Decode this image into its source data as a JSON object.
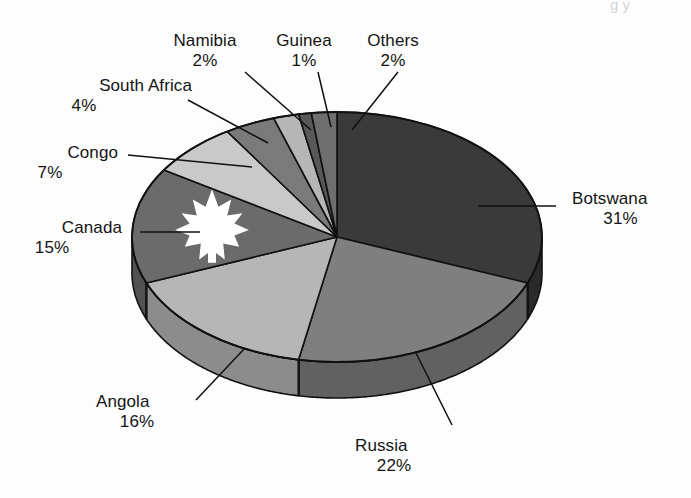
{
  "figure": {
    "background": "#fdfdfd",
    "width": 691,
    "height": 498,
    "clipped_top_text": "g y"
  },
  "chart_data": {
    "type": "pie",
    "title": "",
    "subtitle": "",
    "xlabel": "",
    "ylabel": "",
    "style": "3d-pie",
    "legend_position": "none",
    "labels_position": "outside-with-leader-lines",
    "start_angle_deg": 0,
    "direction": "clockwise",
    "categories": [
      "Botswana",
      "Russia",
      "Angola",
      "Canada",
      "Congo",
      "South Africa",
      "Namibia",
      "Guinea",
      "Others"
    ],
    "values": [
      31,
      22,
      16,
      15,
      7,
      4,
      2,
      1,
      2
    ],
    "value_unit": "%",
    "total": 100,
    "slices": [
      {
        "label": "Botswana",
        "value": 31,
        "pct_text": "31%",
        "color": "#3a3a3a",
        "side_color": "#2a2a2a"
      },
      {
        "label": "Russia",
        "value": 22,
        "pct_text": "22%",
        "color": "#7f7f7f",
        "side_color": "#616161"
      },
      {
        "label": "Angola",
        "value": 16,
        "pct_text": "16%",
        "color": "#b6b6b6",
        "side_color": "#8c8c8c"
      },
      {
        "label": "Canada",
        "value": 15,
        "pct_text": "15%",
        "color": "#6b6b6b",
        "side_color": "#525252",
        "emblem": "maple-leaf",
        "emblem_color": "#ffffff"
      },
      {
        "label": "Congo",
        "value": 7,
        "pct_text": "7%",
        "color": "#c9c9c9",
        "side_color": "#9c9c9c"
      },
      {
        "label": "South Africa",
        "value": 4,
        "pct_text": "4%",
        "color": "#7a7a7a",
        "side_color": "#5e5e5e"
      },
      {
        "label": "Namibia",
        "value": 2,
        "pct_text": "2%",
        "color": "#b6b6b6",
        "side_color": "#8c8c8c"
      },
      {
        "label": "Guinea",
        "value": 1,
        "pct_text": "1%",
        "color": "#585858",
        "side_color": "#444444"
      },
      {
        "label": "Others",
        "value": 2,
        "pct_text": "2%",
        "color": "#6e6e6e",
        "side_color": "#555555"
      }
    ]
  },
  "labels": {
    "botswana": {
      "name": "Botswana",
      "pct": "31%"
    },
    "russia": {
      "name": "Russia",
      "pct": "22%"
    },
    "angola": {
      "name": "Angola",
      "pct": "16%"
    },
    "canada": {
      "name": "Canada",
      "pct": "15%"
    },
    "congo": {
      "name": "Congo",
      "pct": "7%"
    },
    "south_africa": {
      "name": "South Africa",
      "pct": "4%"
    },
    "namibia": {
      "name": "Namibia",
      "pct": "2%"
    },
    "guinea": {
      "name": "Guinea",
      "pct": "1%"
    },
    "others": {
      "name": "Others",
      "pct": "2%"
    }
  },
  "colors": {
    "outline": "#111111",
    "text": "#141414",
    "emblem": "#ffffff",
    "page": "#fdfdfd"
  }
}
